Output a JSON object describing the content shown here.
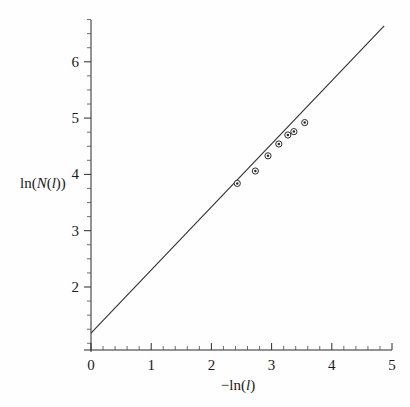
{
  "figure": {
    "background_color": "#fefefe",
    "foreground_color": "#2b2b2b",
    "marker_fill": "#ffffff"
  },
  "axes": {
    "x": {
      "title_parts": {
        "minus": "−",
        "fn": "ln(",
        "var": "l",
        "close": ")"
      },
      "title": "−ln(l)",
      "tick_labels": [
        "0",
        "1",
        "2",
        "3",
        "4",
        "5"
      ],
      "tick_values": [
        0,
        1,
        2,
        3,
        4,
        5
      ],
      "minor_per_major": 5,
      "range": [
        0,
        5
      ]
    },
    "y": {
      "title_parts": {
        "fn": "ln(",
        "varN": "N",
        "open": "(",
        "varL": "l",
        "close": "))"
      },
      "title": "ln(N(l))",
      "tick_labels": [
        "2",
        "3",
        "4",
        "5",
        "6"
      ],
      "tick_values": [
        2,
        3,
        4,
        5,
        6
      ],
      "minor_per_major": 4,
      "range": [
        0.65,
        6.75
      ]
    }
  },
  "chart_data": {
    "type": "scatter",
    "title": "",
    "xlabel": "−ln(l)",
    "ylabel": "ln(N(l))",
    "xlim": [
      0,
      5
    ],
    "ylim": [
      0.65,
      6.75
    ],
    "grid": false,
    "legend": null,
    "legend_position": "none",
    "series": [
      {
        "name": "box-count data",
        "marker": "open-circle",
        "x": [
          2.43,
          2.73,
          2.94,
          3.12,
          3.27,
          3.37,
          3.55
        ],
        "y": [
          3.84,
          4.06,
          4.33,
          4.54,
          4.7,
          4.76,
          4.92
        ]
      },
      {
        "name": "linear fit",
        "type": "line",
        "x": [
          0.0,
          4.87
        ],
        "y": [
          1.18,
          6.64
        ],
        "slope": 1.12,
        "intercept": 1.18
      }
    ]
  }
}
